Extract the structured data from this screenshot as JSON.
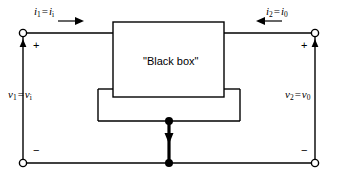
{
  "diagram": {
    "title_text": "\"Black box\"",
    "stroke_color": "#000000",
    "background_color": "#ffffff",
    "labels": {
      "current_left_main": "i",
      "current_left_sub1": "1",
      "current_left_eq": "=",
      "current_left_main2": "i",
      "current_left_sub2": "i",
      "current_right_main": "i",
      "current_right_sub1": "2",
      "current_right_eq": "=",
      "current_right_main2": "i",
      "current_right_sub2": "0",
      "voltage_left_main": "v",
      "voltage_left_sub1": "1",
      "voltage_left_eq": "=",
      "voltage_left_main2": "v",
      "voltage_left_sub2": "i",
      "voltage_right_main": "v",
      "voltage_right_sub1": "2",
      "voltage_right_eq": "=",
      "voltage_right_main2": "v",
      "voltage_right_sub2": "0",
      "plus_left": "+",
      "plus_right": "+",
      "minus_left": "−",
      "minus_right": "−"
    }
  }
}
